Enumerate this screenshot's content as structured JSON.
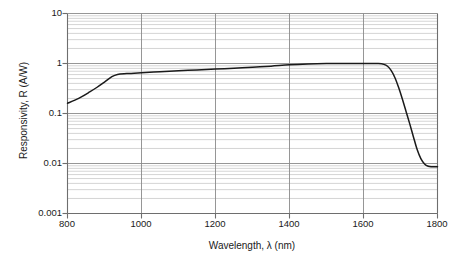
{
  "chart_data": {
    "type": "line",
    "title": "",
    "xlabel": "Wavelength, λ (nm)",
    "ylabel": "Responsivity, R (A/W)",
    "xscale": "linear",
    "yscale": "log",
    "xlim": [
      800,
      1800
    ],
    "ylim": [
      0.001,
      10
    ],
    "xticks": [
      800,
      1000,
      1200,
      1400,
      1600,
      1800
    ],
    "xticklabels": [
      "800",
      "1000",
      "1200",
      "1400",
      "1600",
      "1800"
    ],
    "yticks": [
      0.001,
      0.01,
      0.1,
      1,
      10
    ],
    "yticklabels": [
      "0.001",
      "0.01",
      "0.1",
      "1",
      "10"
    ],
    "grid": "major and minor horizontal log gridlines, major vertical gridlines",
    "legend": "none",
    "series": [
      {
        "name": "Responsivity",
        "color": "#1a1a1a",
        "x": [
          800,
          820,
          840,
          860,
          880,
          900,
          920,
          935,
          960,
          1000,
          1050,
          1100,
          1150,
          1200,
          1250,
          1300,
          1350,
          1400,
          1450,
          1500,
          1550,
          1600,
          1620,
          1640,
          1655,
          1665,
          1675,
          1685,
          1695,
          1705,
          1715,
          1725,
          1735,
          1745,
          1755,
          1765,
          1775,
          1785,
          1800
        ],
        "y": [
          0.16,
          0.185,
          0.22,
          0.27,
          0.335,
          0.425,
          0.545,
          0.605,
          0.63,
          0.655,
          0.685,
          0.715,
          0.745,
          0.775,
          0.805,
          0.84,
          0.885,
          0.94,
          0.975,
          0.995,
          1.0,
          1.0,
          1.0,
          0.995,
          0.96,
          0.88,
          0.72,
          0.52,
          0.33,
          0.195,
          0.11,
          0.062,
          0.034,
          0.019,
          0.0125,
          0.0098,
          0.0088,
          0.0086,
          0.0086
        ]
      }
    ]
  },
  "axes": {
    "x_tick_labels": [
      "800",
      "1000",
      "1200",
      "1400",
      "1600",
      "1800"
    ],
    "y_tick_labels": [
      "10",
      "1",
      "0.1",
      "0.01",
      "0.001"
    ],
    "x_axis_title": "Wavelength, λ (nm)",
    "y_axis_title": "Responsivity, R (A/W)"
  },
  "colors": {
    "curve": "#1a1a1a",
    "axis": "#6e6e6e",
    "major_grid": "#8a8a8a",
    "minor_grid": "#c9c9c9",
    "background": "#ffffff",
    "text": "#1a1a1a"
  }
}
